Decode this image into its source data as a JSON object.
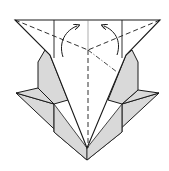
{
  "diagram": {
    "type": "origami-fold-diagram",
    "colors": {
      "paper_white": "#ffffff",
      "paper_gray": "#d9d9d9",
      "line": "#1a1a1a",
      "thin_line": "#777777"
    },
    "symbols": [
      {
        "name": "valley-fold-line",
        "style": "dashed"
      },
      {
        "name": "mountain-fold-line",
        "style": "dash-dot"
      },
      {
        "name": "fold-arrow-left",
        "direction": "up-right"
      },
      {
        "name": "fold-arrow-right",
        "direction": "up-left"
      }
    ]
  }
}
